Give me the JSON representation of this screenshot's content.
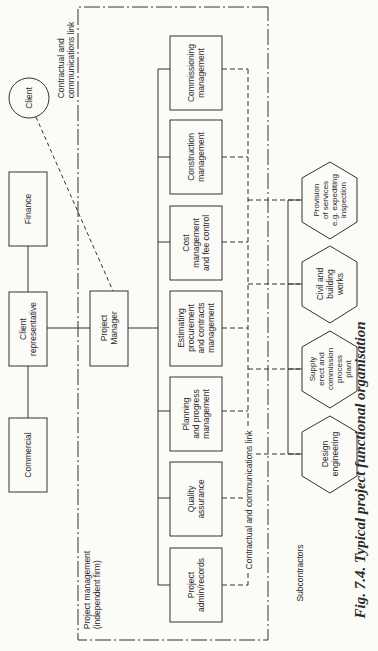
{
  "diagram": {
    "caption": "Fig. 7.4.   Typical project functional organisation",
    "client": {
      "label": "Client"
    },
    "client_side_boxes": [
      {
        "id": "finance",
        "label": "Finance"
      },
      {
        "id": "client-representative",
        "label": "Client\nrepresentative"
      },
      {
        "id": "commercial",
        "label": "Commercial"
      }
    ],
    "project_manager": {
      "label": "Project\nManager"
    },
    "boundary_labels": {
      "project_management": "Project management\n(independent firm)",
      "top_link": "Contractual and\ncommunications link",
      "bottom_link": "Contractual and communications link",
      "subcontractors": "Subcontractors"
    },
    "functions": [
      {
        "id": "commissioning",
        "label": "Commissioning\nmanagement"
      },
      {
        "id": "construction",
        "label": "Construction\nmanagement"
      },
      {
        "id": "cost",
        "label": "Cost\nmanagement\nand fee control"
      },
      {
        "id": "estimating",
        "label": "Estimating\nprocurement\nand contracts\nmanagement"
      },
      {
        "id": "planning",
        "label": "Planning\nand progress\nmanagement"
      },
      {
        "id": "quality",
        "label": "Quality\nassurance"
      },
      {
        "id": "admin",
        "label": "Project\nadmin/records"
      }
    ],
    "subcontractors": [
      {
        "id": "services",
        "label": "Provision\nof services\ne.g. expediting\ninspection"
      },
      {
        "id": "civil",
        "label": "Civil and\nbuilding\nworks"
      },
      {
        "id": "supply",
        "label": "Supply\nerect and\ncommission\nprocess\nplant"
      },
      {
        "id": "design",
        "label": "Design\nengineering"
      }
    ]
  }
}
